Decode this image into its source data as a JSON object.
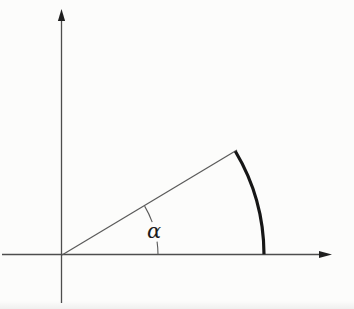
{
  "diagram": {
    "type": "angle-in-standard-position",
    "angle_label": "α",
    "angle_deg": 31,
    "colors": {
      "background": "#fcfcfb",
      "axis": "#4d4d4d",
      "arrowhead": "#1f1f1f",
      "ray": "#5a5a5a",
      "angle_arc": "#5a5a5a",
      "terminal_arc": "#161616",
      "label": "#1c1c1c"
    },
    "origin": {
      "x": 62,
      "y": 255
    },
    "y_axis": {
      "x": 61.5,
      "top_tip_y": 9,
      "bottom_y": 303,
      "arrow_len": 12,
      "arrow_half_w": 3.6
    },
    "x_axis": {
      "y": 254.5,
      "left_x": 2,
      "right_tip_x": 332,
      "arrow_len": 13,
      "arrow_half_w": 3.6
    },
    "ray": {
      "end_x": 237,
      "end_y": 150,
      "width": 1.2
    },
    "terminal_arc": {
      "radius": 202,
      "start_deg": 0.2,
      "end_deg": 30.9,
      "width": 3.2
    },
    "angle_arc": {
      "radius": 96,
      "width": 1.1,
      "segments": [
        {
          "from_deg": 0.3,
          "to_deg": 8.0
        },
        {
          "from_deg": 20.0,
          "to_deg": 30.6
        }
      ]
    },
    "label_pos": {
      "x": 147,
      "y": 238,
      "font_size": 21
    }
  }
}
